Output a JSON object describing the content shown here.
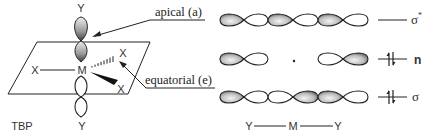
{
  "figure": {
    "left_panel": {
      "geometry_label": "TBP",
      "central_atom": "M",
      "apical_ligands": [
        "Y",
        "Y"
      ],
      "equatorial_ligands": [
        "X",
        "X",
        "X"
      ],
      "callouts": {
        "apical": "apical (a)",
        "equatorial": "equatorial (e)"
      }
    },
    "right_panel": {
      "orbitals": [
        {
          "label": "σ",
          "superscript": "*",
          "occupancy": "empty",
          "lobe_pattern": [
            "shaded",
            "open",
            "shaded",
            "open",
            "shaded",
            "open"
          ]
        },
        {
          "label": "n",
          "superscript": "",
          "occupancy": "paired",
          "lobe_pattern": [
            "shaded",
            "open",
            "node",
            "open",
            "shaded"
          ]
        },
        {
          "label": "σ",
          "superscript": "",
          "occupancy": "paired",
          "lobe_pattern": [
            "shaded",
            "open",
            "open",
            "shaded",
            "shaded",
            "open"
          ]
        }
      ],
      "axis_label": {
        "left": "Y",
        "center": "M",
        "right": "Y"
      }
    }
  },
  "colors": {
    "line": "#222222",
    "shade_dark": "#555555",
    "shade_light": "#f2f2f2",
    "background": "#ffffff"
  }
}
